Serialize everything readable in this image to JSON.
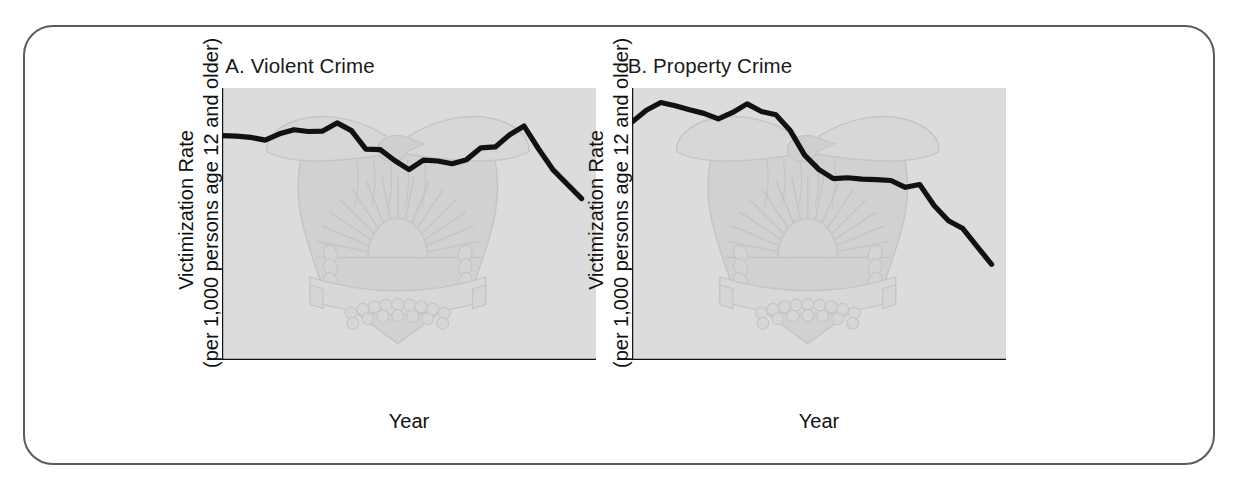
{
  "figure": {
    "frame_color": "#5b5b5b",
    "background": "#ffffff"
  },
  "panels": [
    {
      "id": "panel-a",
      "title": "A. Violent Crime",
      "ylabel_line1": "Victimization Rate",
      "ylabel_line2": "(per 1,000 persons age 12 and older)",
      "xlabel": "Year"
    },
    {
      "id": "panel-b",
      "title": "B. Property Crime",
      "ylabel_line1": "Victimization Rate",
      "ylabel_line2": "(per 1,000 persons age 12 and older)",
      "xlabel": "Year"
    }
  ],
  "chart_data": [
    {
      "type": "line",
      "title": "A. Violent Crime",
      "xlabel": "Year",
      "ylabel": "Victimization Rate (per 1,000 persons age 12 and older)",
      "xlim": [
        1973,
        1999
      ],
      "ylim": [
        0,
        60
      ],
      "ytick_labels": [
        "0",
        "10",
        "20",
        "30",
        "40",
        "50",
        "60"
      ],
      "yticks": [
        0,
        10,
        20,
        30,
        40,
        50,
        60
      ],
      "xtick_labels": [
        "1973",
        "1977",
        "1981",
        "1985",
        "1989",
        "1993",
        "1997"
      ],
      "xticks_labeled": [
        1973,
        1977,
        1981,
        1985,
        1989,
        1993,
        1997
      ],
      "xticks_minor_every": 1,
      "grid": false,
      "legend": "none",
      "line_color": "#111111",
      "plot_background": "#dcdcdc",
      "x": [
        1973,
        1974,
        1975,
        1976,
        1977,
        1978,
        1979,
        1980,
        1981,
        1982,
        1983,
        1984,
        1985,
        1986,
        1987,
        1988,
        1989,
        1990,
        1991,
        1992,
        1993,
        1994,
        1995,
        1996,
        1997,
        1998
      ],
      "values": [
        49.5,
        49.4,
        49.1,
        48.5,
        49.9,
        50.8,
        50.4,
        50.5,
        52.3,
        50.6,
        46.5,
        46.4,
        44.0,
        42.0,
        44.1,
        43.9,
        43.3,
        44.2,
        46.8,
        47.0,
        49.7,
        51.6,
        46.6,
        42.0,
        38.8,
        35.6
      ]
    },
    {
      "type": "line",
      "title": "B. Property Crime",
      "xlabel": "Year",
      "ylabel": "Victimization Rate (per 1,000 persons age 12 and older)",
      "xlim": [
        1973,
        1999
      ],
      "ylim": [
        0,
        600
      ],
      "ytick_labels": [
        "0",
        "100",
        "200",
        "300",
        "400",
        "500",
        "600"
      ],
      "yticks": [
        0,
        100,
        200,
        300,
        400,
        500,
        600
      ],
      "xtick_labels": [
        "1973",
        "1977",
        "1981",
        "1985",
        "1989",
        "1993",
        "1997"
      ],
      "xticks_labeled": [
        1973,
        1977,
        1981,
        1985,
        1989,
        1993,
        1997
      ],
      "xticks_minor_every": 1,
      "grid": false,
      "legend": "none",
      "line_color": "#111111",
      "plot_background": "#dcdcdc",
      "x": [
        1973,
        1974,
        1975,
        1976,
        1977,
        1978,
        1979,
        1980,
        1981,
        1982,
        1983,
        1984,
        1985,
        1986,
        1987,
        1988,
        1989,
        1990,
        1991,
        1992,
        1993,
        1994,
        1995,
        1996,
        1997,
        1998
      ],
      "values": [
        525,
        551,
        568,
        561,
        552,
        544,
        532,
        546,
        565,
        548,
        541,
        506,
        452,
        420,
        400,
        402,
        399,
        398,
        396,
        381,
        387,
        341,
        307,
        290,
        250,
        211
      ]
    }
  ]
}
